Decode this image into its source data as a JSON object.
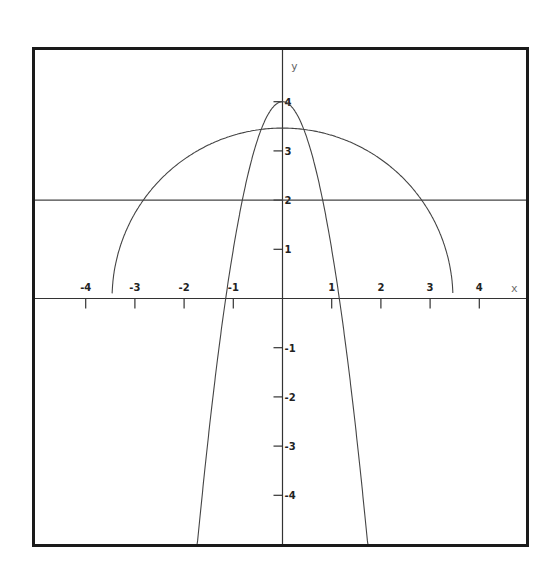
{
  "chart_data": {
    "type": "line",
    "title": "",
    "xlabel": "x",
    "ylabel": "y",
    "xlim": [
      -5.05,
      5.03
    ],
    "ylim": [
      -5.02,
      5.08
    ],
    "grid": false,
    "legend": null,
    "x_ticks": [
      -4,
      -3,
      -2,
      -1,
      1,
      2,
      3,
      4
    ],
    "x_tick_labels": [
      "-4",
      "-3",
      "-2",
      "-1",
      "1",
      "2",
      "3",
      "4"
    ],
    "y_ticks": [
      4,
      3,
      2,
      1,
      -1,
      -2,
      -3,
      -4
    ],
    "y_tick_labels": [
      "4",
      "3",
      "2",
      "1",
      "-1",
      "-2",
      "-3",
      "-4"
    ],
    "series": [
      {
        "name": "parabola",
        "expression": "y = 4 - 3x^2",
        "x": [
          -1.73,
          -1.5,
          -1.25,
          -1.155,
          -1.0,
          -0.75,
          -0.5,
          -0.25,
          0,
          0.25,
          0.5,
          0.75,
          1.0,
          1.155,
          1.25,
          1.5,
          1.73
        ],
        "values": [
          -4.98,
          -2.75,
          -0.69,
          0.0,
          1.0,
          2.31,
          3.25,
          3.81,
          4.0,
          3.81,
          3.25,
          2.31,
          1.0,
          0.0,
          -0.69,
          -2.75,
          -4.98
        ]
      },
      {
        "name": "semicircle",
        "expression": "y = sqrt(12 - x^2)",
        "x": [
          -3.46,
          -3.0,
          -2.5,
          -2.0,
          -1.5,
          -1.0,
          -0.5,
          0,
          0.5,
          1.0,
          1.5,
          2.0,
          2.5,
          3.0,
          3.46
        ],
        "values": [
          0.1,
          1.73,
          2.4,
          2.83,
          3.12,
          3.32,
          3.43,
          3.46,
          3.43,
          3.32,
          3.12,
          2.83,
          2.4,
          1.73,
          0.1
        ]
      },
      {
        "name": "horizontal-line",
        "expression": "y = 2",
        "x": [
          -5.05,
          5.03
        ],
        "values": [
          2,
          2
        ]
      }
    ]
  },
  "labels": {
    "x_axis": "x",
    "y_axis": "y"
  },
  "colors": {
    "frame": "#1a1a1a",
    "axes": "#333333",
    "curves": "#444444",
    "background": "#ffffff"
  }
}
